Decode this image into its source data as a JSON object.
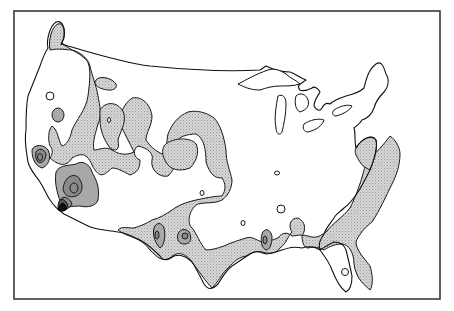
{
  "map": {
    "type": "contour-map",
    "region": "Contiguous United States",
    "legend": [],
    "shading_levels": [
      {
        "level": 0,
        "fill": "#ffffff"
      },
      {
        "level": 1,
        "fill": "#d0d0d0"
      },
      {
        "level": 2,
        "fill": "#a8a8a8"
      },
      {
        "level": 3,
        "fill": "#8a8a8a"
      },
      {
        "level": 4,
        "fill": "#555555"
      },
      {
        "level": 5,
        "fill": "#111111"
      }
    ],
    "colors": {
      "frame": "#3a3a3a",
      "outline": "#111111",
      "background": "#ffffff"
    }
  }
}
